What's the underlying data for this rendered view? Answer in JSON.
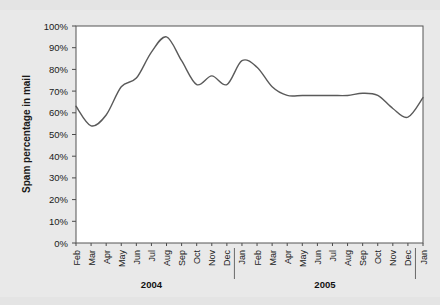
{
  "chart_data": {
    "type": "line",
    "title": "",
    "xlabel": "",
    "ylabel": "Spam percentage in mail",
    "ylim": [
      0,
      100
    ],
    "grid": false,
    "legend": "none",
    "y_ticks": [
      "0%",
      "10%",
      "20%",
      "30%",
      "40%",
      "50%",
      "60%",
      "70%",
      "80%",
      "90%",
      "100%"
    ],
    "y_tick_values": [
      0,
      10,
      20,
      30,
      40,
      50,
      60,
      70,
      80,
      90,
      100
    ],
    "categories": [
      "Feb",
      "Mar",
      "Apr",
      "May",
      "Jun",
      "Jul",
      "Aug",
      "Sep",
      "Oct",
      "Nov",
      "Dec",
      "Jan",
      "Feb",
      "Mar",
      "Apr",
      "May",
      "Jun",
      "Jul",
      "Aug",
      "Sep",
      "Oct",
      "Nov",
      "Dec",
      "Jan"
    ],
    "values": [
      63,
      54,
      59,
      72,
      76,
      88,
      95,
      84,
      73,
      77,
      73,
      84,
      81,
      72,
      68,
      68,
      68,
      68,
      68,
      69,
      68,
      62,
      58,
      67
    ],
    "year_groups": [
      {
        "label": "2004",
        "start_index": 0,
        "end_index": 10
      },
      {
        "label": "2005",
        "start_index": 11,
        "end_index": 22
      }
    ],
    "series_color": "#5a5a5a",
    "plot_background": "#ffffff",
    "figure_background": "#e9e9e9",
    "axis_color": "#555555"
  }
}
